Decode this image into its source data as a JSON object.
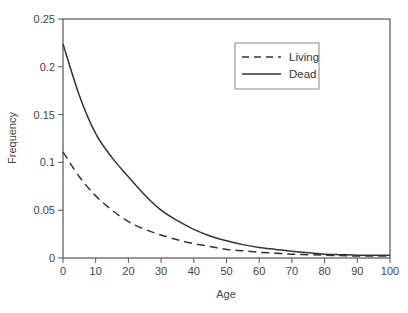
{
  "chart_data": {
    "type": "line",
    "title": "",
    "xlabel": "Age",
    "ylabel": "Frequency",
    "xlim": [
      0,
      100
    ],
    "ylim": [
      0,
      0.25
    ],
    "grid": false,
    "legend_position": "upper right (inside)",
    "x_ticks": [
      "0",
      "10",
      "20",
      "30",
      "40",
      "50",
      "60",
      "70",
      "80",
      "90",
      "100"
    ],
    "y_ticks": [
      "0",
      "0.05",
      "0.1",
      "0.15",
      "0.2",
      "0.25"
    ],
    "x": [
      0,
      5,
      10,
      15,
      20,
      25,
      30,
      35,
      40,
      45,
      50,
      55,
      60,
      65,
      70,
      75,
      80,
      85,
      90,
      95,
      100
    ],
    "series": [
      {
        "name": "Living",
        "style": "dashed",
        "color": "#333333",
        "values": [
          0.111,
          0.085,
          0.065,
          0.05,
          0.038,
          0.03,
          0.024,
          0.019,
          0.015,
          0.012,
          0.009,
          0.0075,
          0.006,
          0.005,
          0.004,
          0.0035,
          0.003,
          0.0025,
          0.002,
          0.002,
          0.002
        ]
      },
      {
        "name": "Dead",
        "style": "solid",
        "color": "#333333",
        "values": [
          0.224,
          0.17,
          0.13,
          0.105,
          0.085,
          0.066,
          0.05,
          0.039,
          0.03,
          0.023,
          0.018,
          0.014,
          0.011,
          0.009,
          0.007,
          0.0055,
          0.004,
          0.0035,
          0.003,
          0.003,
          0.003
        ]
      }
    ]
  },
  "legend": {
    "items": [
      {
        "label": "Living",
        "style": "dashed"
      },
      {
        "label": "Dead",
        "style": "solid"
      }
    ]
  },
  "axes": {
    "x_label": "Age",
    "y_label": "Frequency"
  }
}
